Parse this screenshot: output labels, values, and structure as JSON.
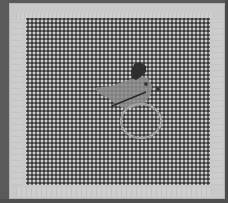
{
  "image": {
    "description": "Grayscale photo of a plastic mesh canvas in a light frame with a small charm object (wing/bird shape on a ring) near the center",
    "colors": {
      "background_edge": "#5a5a5a",
      "frame": "#c9c9c9",
      "mesh_lines": "#cfcfcf",
      "mesh_holes": "#787878",
      "object_body": "#8a8a8a",
      "object_dark": "#2e2e2e",
      "ring_outline": "#a0a0a0"
    },
    "elements": [
      {
        "name": "frame",
        "shape": "rectangle"
      },
      {
        "name": "mesh-grid",
        "cell_pitch_px": 4
      },
      {
        "name": "charm-wing",
        "shape": "pennant"
      },
      {
        "name": "charm-tuft",
        "shape": "dark blob"
      },
      {
        "name": "charm-stick",
        "shape": "diagonal line"
      },
      {
        "name": "charm-ring",
        "shape": "oval outline"
      }
    ]
  }
}
